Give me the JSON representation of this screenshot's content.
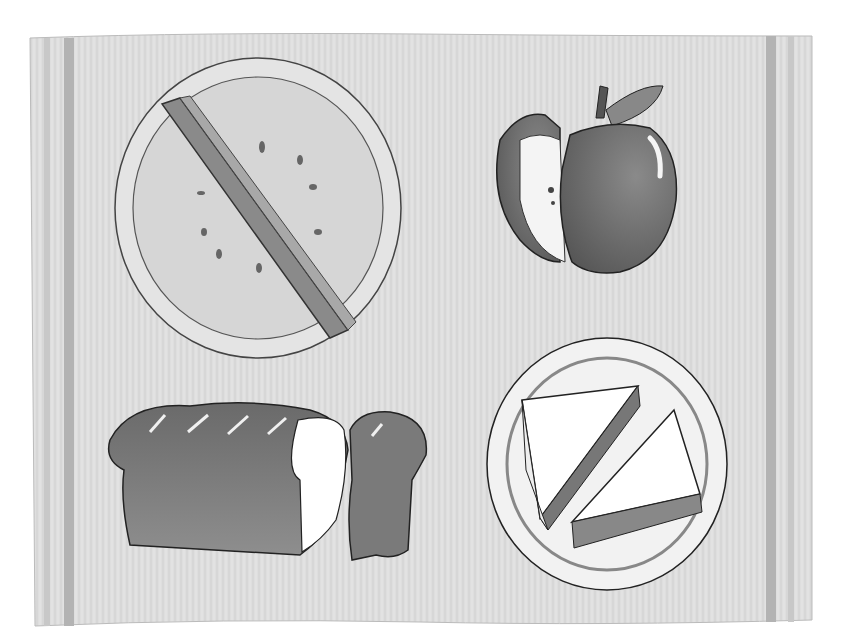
{
  "image": {
    "description": "Grayscale watercolor illustration of a placemat with four foods",
    "style": "watercolor, grayscale",
    "placemat": {
      "stripe_color": "#b5b5b5",
      "fill": "#dcdcdc"
    },
    "items": [
      {
        "name": "pie",
        "label": "Pie cut in half",
        "position": "top-left"
      },
      {
        "name": "apple",
        "label": "Apple with a slice cut out",
        "position": "top-right"
      },
      {
        "name": "bread",
        "label": "Loaf of bread with a cut end",
        "position": "bottom-left"
      },
      {
        "name": "sandwich",
        "label": "Sandwich cut into two triangles on a plate",
        "position": "bottom-right"
      }
    ]
  }
}
